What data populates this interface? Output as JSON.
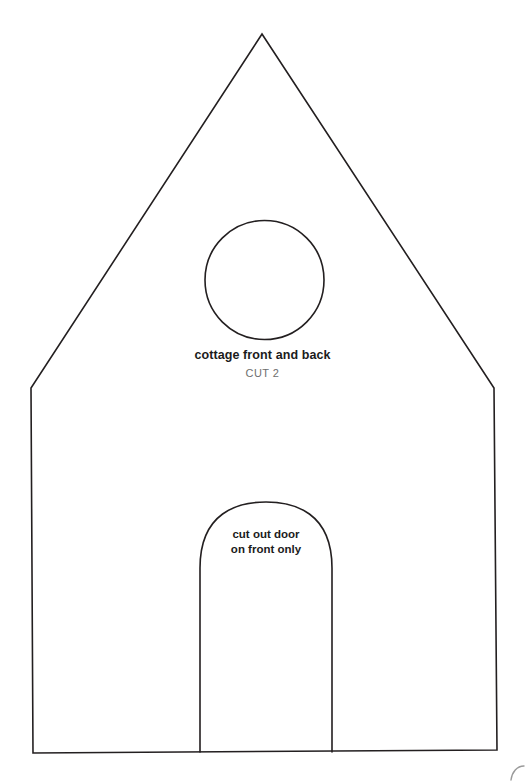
{
  "document": {
    "kind": "craft-template",
    "title": "cottage front and back",
    "background_color": "#ffffff",
    "stroke_color": "#231f20",
    "canvas": {
      "width": 525,
      "height": 784
    }
  },
  "labels": {
    "piece_name": "cottage front and back",
    "cut_quantity": "CUT 2",
    "piece_name_color": "#1b1b1b",
    "cut_quantity_color": "#6e6e6e",
    "door_note_line1": "cut out door",
    "door_note_line2": "on front only",
    "door_note_color": "#1b1b1b"
  },
  "shapes": {
    "house_outline": {
      "name": "cottage-front-outline",
      "stroke": "#231f20",
      "stroke_width": 1.6,
      "fill": "none",
      "points": [
        [
          262,
          34
        ],
        [
          494,
          388
        ],
        [
          497,
          750
        ],
        [
          33,
          753
        ],
        [
          31,
          388
        ]
      ]
    },
    "window_circle": {
      "name": "round-window",
      "stroke": "#231f20",
      "stroke_width": 1.6,
      "fill": "none",
      "cx": 264.5,
      "cy": 280,
      "r": 59.5
    },
    "door_arch": {
      "name": "arched-door",
      "stroke": "#231f20",
      "stroke_width": 1.6,
      "fill": "none",
      "left_x": 200,
      "right_x": 332,
      "arch_top_y": 502,
      "spring_y": 568,
      "bottom_y": 752
    },
    "corner_mark": {
      "name": "adjacent-template-edge",
      "stroke": "#9a9a9a",
      "stroke_width": 1.4,
      "fill": "none"
    }
  }
}
